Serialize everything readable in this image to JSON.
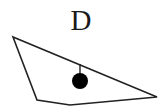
{
  "diagram": {
    "label": "D",
    "stroke_color": "#222222",
    "fill_color": "#000000",
    "shape": {
      "type": "quadrilateral",
      "points": "13,37 37,100 70,105 157,97"
    },
    "pendulum": {
      "stick": {
        "x1": 80,
        "y1": 64,
        "x2": 80,
        "y2": 75
      },
      "ball": {
        "cx": 80,
        "cy": 81,
        "r": 8
      }
    }
  }
}
